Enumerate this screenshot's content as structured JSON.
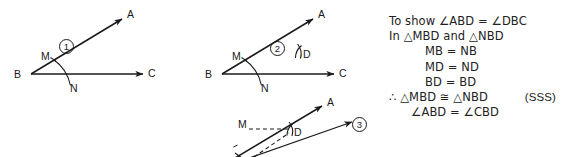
{
  "document": {
    "kind": "geometry-construction-figure",
    "title_text": "Angle bisector construction with SSS congruence proof"
  },
  "figures": [
    {
      "step_label": "1",
      "caption": "Arc drawn from vertex B cutting ray BA at M and ray BC at N",
      "vertex_label": "B",
      "ray_labels": [
        "A",
        "C"
      ],
      "point_labels": [
        "M",
        "N"
      ]
    },
    {
      "step_label": "2",
      "caption": "Arcs from M and N intersect at D",
      "vertex_label": "B",
      "ray_labels": [
        "A",
        "C"
      ],
      "point_labels": [
        "M",
        "N",
        "D"
      ]
    },
    {
      "step_label": "3",
      "caption": "Bisector BD drawn, with MD and ND joined",
      "vertex_label": "B",
      "ray_labels": [
        "A",
        "C"
      ],
      "point_labels": [
        "M",
        "N",
        "D"
      ]
    }
  ],
  "proof": {
    "lines": [
      {
        "text": "To show ∠ABD  =  ∠DBC",
        "indent": "none",
        "tag": ""
      },
      {
        "text": "In △MBD and △NBD",
        "indent": "none",
        "tag": ""
      },
      {
        "text": "MB  =  NB",
        "indent": "indent-1",
        "tag": ""
      },
      {
        "text": "MD  =  ND",
        "indent": "indent-1",
        "tag": ""
      },
      {
        "text": "BD  =  BD",
        "indent": "indent-1",
        "tag": ""
      },
      {
        "text": "∴ △MBD ≅ △NBD",
        "indent": "none",
        "tag": "(SSS)"
      },
      {
        "text": "∠ABD  =  ∠CBD",
        "indent": "indent-2",
        "tag": ""
      }
    ]
  },
  "colors": {
    "background": "#ffffff",
    "ink": "#1a1a1a",
    "text": "#222222"
  }
}
